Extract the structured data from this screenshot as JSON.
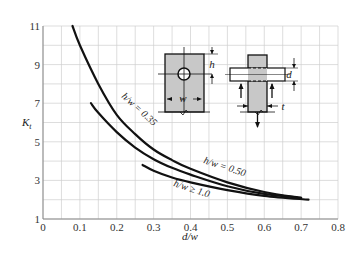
{
  "chart_data": {
    "type": "line",
    "title": "",
    "xlabel": "d/w",
    "ylabel": "K_t",
    "xlim": [
      0,
      0.8
    ],
    "ylim": [
      1,
      11
    ],
    "grid": true,
    "x_ticks": [
      "0",
      "0.1",
      "0.2",
      "0.3",
      "0.4",
      "0.5",
      "0.6",
      "0.7",
      "0.8"
    ],
    "y_ticks": [
      "1",
      "3",
      "5",
      "7",
      "9",
      "11"
    ],
    "series": [
      {
        "name": "h/w = 0.35",
        "x": [
          0.08,
          0.1,
          0.15,
          0.2,
          0.25,
          0.3,
          0.35,
          0.4,
          0.5,
          0.6,
          0.7
        ],
        "values": [
          11.0,
          10.0,
          8.0,
          6.4,
          5.4,
          4.6,
          4.05,
          3.6,
          2.9,
          2.4,
          2.1
        ]
      },
      {
        "name": "h/w = 0.50",
        "x": [
          0.13,
          0.15,
          0.2,
          0.25,
          0.3,
          0.35,
          0.4,
          0.5,
          0.6,
          0.7
        ],
        "values": [
          7.0,
          6.5,
          5.5,
          4.7,
          4.1,
          3.65,
          3.3,
          2.7,
          2.3,
          2.1
        ]
      },
      {
        "name": "h/w ≥ 1.0",
        "x": [
          0.27,
          0.3,
          0.35,
          0.4,
          0.5,
          0.6,
          0.72
        ],
        "values": [
          3.8,
          3.5,
          3.15,
          2.9,
          2.5,
          2.2,
          2.0
        ]
      }
    ],
    "legend": "inline curve labels",
    "annotations": {
      "curve_labels": [
        "h/w = 0.35",
        "h/w = 0.50",
        "h/w ≥ 1.0"
      ],
      "diagram_labels": [
        "h",
        "w",
        "d",
        "t"
      ]
    }
  }
}
